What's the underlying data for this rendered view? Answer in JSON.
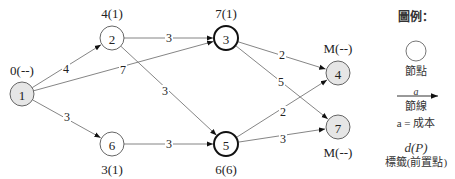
{
  "diagram": {
    "type": "directed-weighted-graph",
    "colors": {
      "edge": "#777777",
      "arrow": "#111111",
      "node_shaded_fill": "#e6e6e6",
      "node_plain_fill": "#ffffff",
      "node_border": "#555555",
      "node_border_bold": "#111111"
    },
    "nodes": [
      {
        "id": "1",
        "x": 22,
        "y": 94,
        "shaded": true,
        "bold": false,
        "label": "0(--)",
        "label_x": 22,
        "label_y": 70
      },
      {
        "id": "2",
        "x": 112,
        "y": 38,
        "shaded": false,
        "bold": false,
        "label": "4(1)",
        "label_x": 112,
        "label_y": 13
      },
      {
        "id": "3",
        "x": 226,
        "y": 38,
        "shaded": false,
        "bold": true,
        "label": "7(1)",
        "label_x": 226,
        "label_y": 13
      },
      {
        "id": "4",
        "x": 338,
        "y": 73,
        "shaded": true,
        "bold": false,
        "label": "M(--)",
        "label_x": 338,
        "label_y": 48
      },
      {
        "id": "5",
        "x": 226,
        "y": 144,
        "shaded": false,
        "bold": true,
        "label": "6(6)",
        "label_x": 226,
        "label_y": 169
      },
      {
        "id": "6",
        "x": 112,
        "y": 144,
        "shaded": false,
        "bold": false,
        "label": "3(1)",
        "label_x": 112,
        "label_y": 169
      },
      {
        "id": "7",
        "x": 338,
        "y": 127,
        "shaded": true,
        "bold": false,
        "label": "M(--)",
        "label_x": 338,
        "label_y": 152
      }
    ],
    "edges": [
      {
        "from": "1",
        "to": "2",
        "cost": "4",
        "lx": 66,
        "ly": 69
      },
      {
        "from": "1",
        "to": "3",
        "cost": "7",
        "lx": 123,
        "ly": 70
      },
      {
        "from": "1",
        "to": "6",
        "cost": "3",
        "lx": 67,
        "ly": 117
      },
      {
        "from": "2",
        "to": "3",
        "cost": "3",
        "lx": 169,
        "ly": 38
      },
      {
        "from": "2",
        "to": "5",
        "cost": "3",
        "lx": 165,
        "ly": 91
      },
      {
        "from": "6",
        "to": "5",
        "cost": "3",
        "lx": 169,
        "ly": 144
      },
      {
        "from": "3",
        "to": "4",
        "cost": "2",
        "lx": 282,
        "ly": 55
      },
      {
        "from": "3",
        "to": "7",
        "cost": "5",
        "lx": 281,
        "ly": 82
      },
      {
        "from": "5",
        "to": "4",
        "cost": "2",
        "lx": 283,
        "ly": 112
      },
      {
        "from": "5",
        "to": "7",
        "cost": "3",
        "lx": 283,
        "ly": 139
      }
    ],
    "node_radius": 12
  },
  "legend": {
    "title": "圖例：",
    "node_label": "節點",
    "edge_symbol": "a",
    "edge_label": "節線",
    "cost_note": "a = 成本",
    "tag_symbol": "d(P)",
    "tag_label": "標籤(前置點)"
  }
}
